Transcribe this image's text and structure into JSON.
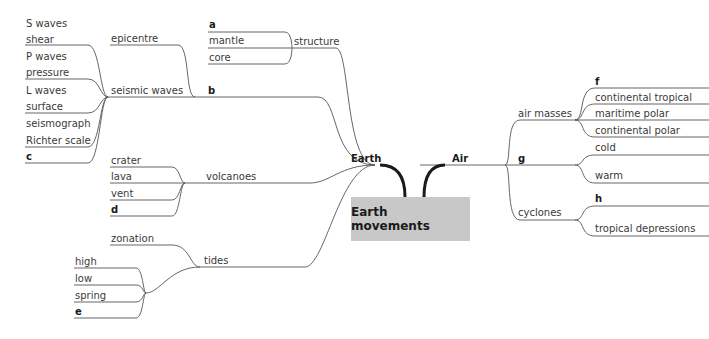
{
  "central_topic": "Earth movements",
  "branches": {
    "earth": {
      "label": "Earth",
      "structure": {
        "label": "structure",
        "children": [
          "a",
          "mantle",
          "core"
        ]
      },
      "seismic_waves": {
        "label": "seismic waves",
        "epicentre": "epicentre",
        "b": "b",
        "children": [
          "S waves",
          "shear",
          "P waves",
          "pressure",
          "L waves",
          "surface",
          "seismograph",
          "Richter scale",
          "c"
        ]
      },
      "volcanoes": {
        "label": "volcanoes",
        "children": [
          "crater",
          "lava",
          "vent",
          "d"
        ]
      },
      "tides": {
        "label": "tides",
        "zonation": "zonation",
        "children": [
          "high",
          "low",
          "spring",
          "e"
        ]
      }
    },
    "air": {
      "label": "Air",
      "air_masses": {
        "label": "air masses",
        "children": [
          "f",
          "continental tropical",
          "maritime polar",
          "continental polar"
        ]
      },
      "g": {
        "label": "g",
        "children": [
          "cold",
          "warm"
        ]
      },
      "cyclones": {
        "label": "cyclones",
        "children": [
          "h",
          "tropical depressions"
        ]
      }
    }
  },
  "colors": {
    "central_fill": "#c8c8c8",
    "line": "#555555",
    "thick_line": "#1a1a1a"
  }
}
